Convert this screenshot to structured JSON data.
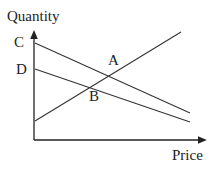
{
  "diagram": {
    "y_axis_label": "Quantity",
    "x_axis_label": "Price",
    "points": {
      "C": "C",
      "D": "D",
      "A": "A",
      "B": "B"
    },
    "lines": [
      {
        "name": "line-from-C",
        "from": [
          35,
          43
        ],
        "to": [
          190,
          113
        ]
      },
      {
        "name": "line-from-D",
        "from": [
          35,
          69
        ],
        "to": [
          190,
          122
        ]
      },
      {
        "name": "upward-line",
        "from": [
          35,
          121
        ],
        "to": [
          181,
          32
        ]
      }
    ],
    "colors": {
      "line": "#333333",
      "axis": "#222222"
    }
  }
}
